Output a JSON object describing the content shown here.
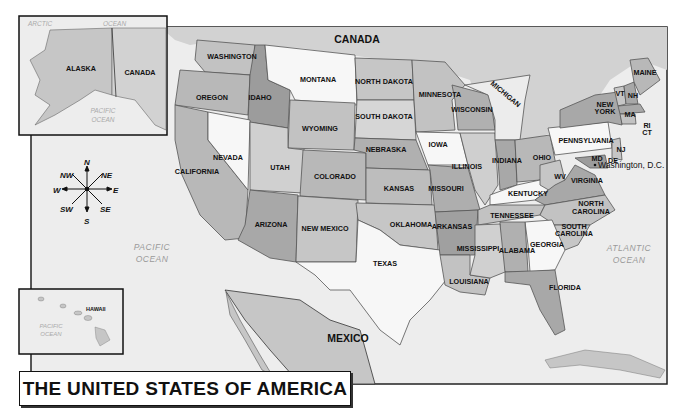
{
  "title": "THE UNITED STATES OF AMERICA",
  "insets": {
    "alaska": {
      "state": "ALASKA",
      "neighbor": "CANADA",
      "oceans": [
        "ARCTIC",
        "OCEAN",
        "PACIFIC",
        "OCEAN"
      ]
    },
    "hawaii": {
      "state": "HAWAII",
      "ocean_line1": "PACIFIC",
      "ocean_line2": "OCEAN"
    }
  },
  "neighbors": {
    "north": "CANADA",
    "south": "MEXICO"
  },
  "oceans": {
    "pacific": {
      "line1": "PACIFIC",
      "line2": "OCEAN"
    },
    "atlantic": {
      "line1": "ATLANTIC",
      "line2": "OCEAN"
    }
  },
  "capital": "Washington, D.C.",
  "compass": {
    "n": "N",
    "ne": "NE",
    "e": "E",
    "se": "SE",
    "s": "S",
    "sw": "SW",
    "w": "W",
    "nw": "NW"
  },
  "states": {
    "washington": "WASHINGTON",
    "oregon": "OREGON",
    "california": "CALIFORNIA",
    "idaho": "IDAHO",
    "nevada": "NEVADA",
    "montana": "MONTANA",
    "wyoming": "WYOMING",
    "utah": "UTAH",
    "arizona": "ARIZONA",
    "colorado": "COLORADO",
    "new_mexico": "NEW MEXICO",
    "north_dakota": "NORTH DAKOTA",
    "south_dakota": "SOUTH DAKOTA",
    "nebraska": "NEBRASKA",
    "kansas": "KANSAS",
    "oklahoma": "OKLAHOMA",
    "texas": "TEXAS",
    "minnesota": "MINNESOTA",
    "iowa": "IOWA",
    "missouri": "MISSOURI",
    "arkansas": "ARKANSAS",
    "louisiana": "LOUISIANA",
    "wisconsin": "WISCONSIN",
    "illinois": "ILLINOIS",
    "michigan": "MICHIGAN",
    "indiana": "INDIANA",
    "ohio": "OHIO",
    "kentucky": "KENTUCKY",
    "tennessee": "TENNESSEE",
    "mississippi": "MISSISSIPPI",
    "alabama": "ALABAMA",
    "georgia": "GEORGIA",
    "florida": "FLORIDA",
    "south_carolina_1": "SOUTH",
    "south_carolina_2": "CAROLINA",
    "north_carolina_1": "NORTH",
    "north_carolina_2": "CAROLINA",
    "virginia": "VIRGINIA",
    "wv": "WV",
    "pennsylvania": "PENNSYLVANIA",
    "new_york_1": "NEW",
    "new_york_2": "YORK",
    "vt": "VT",
    "nh": "NH",
    "maine": "MAINE",
    "ma": "MA",
    "ri": "RI",
    "ct": "CT",
    "nj": "NJ",
    "md": "MD",
    "de": "DE"
  },
  "colors": {
    "water": "#ededed",
    "land": "#c9c9c9",
    "state_light": "#f7f7f7",
    "state_mid": "#c2c2c2",
    "state_dark": "#9c9c9c",
    "state_medium_dark": "#b0b0b0",
    "border": "#555555",
    "frame": "#222222"
  }
}
